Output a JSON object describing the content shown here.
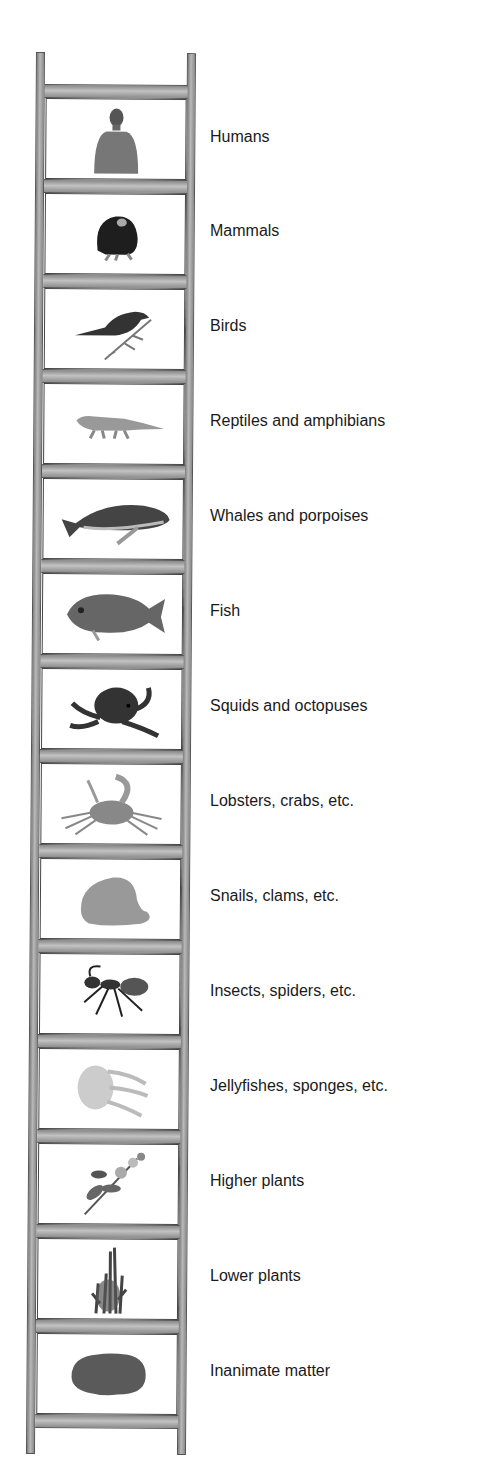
{
  "diagram": {
    "type": "ladder-of-nature",
    "rungs": [
      {
        "label": "Humans",
        "icon": "human-icon"
      },
      {
        "label": "Mammals",
        "icon": "mammal-icon"
      },
      {
        "label": "Birds",
        "icon": "bird-icon"
      },
      {
        "label": "Reptiles and amphibians",
        "icon": "reptile-icon"
      },
      {
        "label": "Whales and porpoises",
        "icon": "whale-icon"
      },
      {
        "label": "Fish",
        "icon": "fish-icon"
      },
      {
        "label": "Squids and octopuses",
        "icon": "octopus-icon"
      },
      {
        "label": "Lobsters, crabs, etc.",
        "icon": "crab-icon"
      },
      {
        "label": "Snails, clams, etc.",
        "icon": "clam-icon"
      },
      {
        "label": "Insects, spiders, etc.",
        "icon": "ant-icon"
      },
      {
        "label": "Jellyfishes, sponges, etc.",
        "icon": "jellyfish-icon"
      },
      {
        "label": "Higher plants",
        "icon": "flowering-plant-icon"
      },
      {
        "label": "Lower plants",
        "icon": "moss-icon"
      },
      {
        "label": "Inanimate matter",
        "icon": "rock-icon"
      }
    ]
  },
  "colors": {
    "rail": "#9a9a9a",
    "outline": "#444444",
    "text": "#1a1a1a"
  }
}
